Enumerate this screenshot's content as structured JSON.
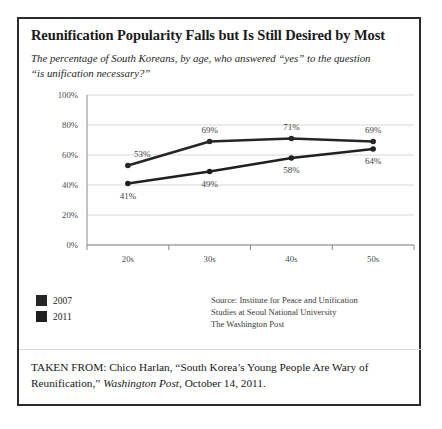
{
  "figure": {
    "title": "Reunification Popularity Falls but Is Still Desired by Most",
    "subtitle": "The percentage of South Koreans, by age, who answered “yes” to the question “is unification necessary?”",
    "source": {
      "line1": "Source: Institute for Peace and Unification",
      "line2": "Studies at Seoul National University",
      "line3": "The Washington Post"
    },
    "caption": {
      "prefix": "TAKEN FROM: Chico Harlan, “South Korea’s Young People Are Wary of Reunification,” ",
      "italic": "Washington Post",
      "suffix": ", October 14, 2011."
    }
  },
  "chart_data": {
    "type": "line",
    "title": "Reunification Popularity Falls but Is Still Desired by Most",
    "subtitle": "The percentage of South Koreans, by age, who answered “yes” to the question “is unification necessary?”",
    "xlabel": "",
    "ylabel": "",
    "categories": [
      "20s",
      "30s",
      "40s",
      "50s"
    ],
    "series": [
      {
        "name": "2007",
        "color": "#262626",
        "values": [
          53,
          69,
          71,
          69
        ],
        "labels": [
          "53%",
          "69%",
          "71%",
          "69%"
        ],
        "label_positions": [
          "above-left",
          "above",
          "above",
          "above"
        ]
      },
      {
        "name": "2011",
        "color": "#1f1f1f",
        "values": [
          41,
          49,
          58,
          64
        ],
        "labels": [
          "41%",
          "49%",
          "58%",
          "64%"
        ],
        "label_positions": [
          "below",
          "below",
          "below",
          "below"
        ]
      }
    ],
    "ylim": [
      0,
      100
    ],
    "yticks": [
      0,
      20,
      40,
      60,
      80,
      100
    ],
    "ytick_labels": [
      "0%",
      "20%",
      "40%",
      "60%",
      "80%",
      "100%"
    ],
    "grid": true,
    "grid_color": "#d9d9d9",
    "legend_position": "below-left",
    "axis_color": "#8a8a8a",
    "value_suffix": "%"
  }
}
